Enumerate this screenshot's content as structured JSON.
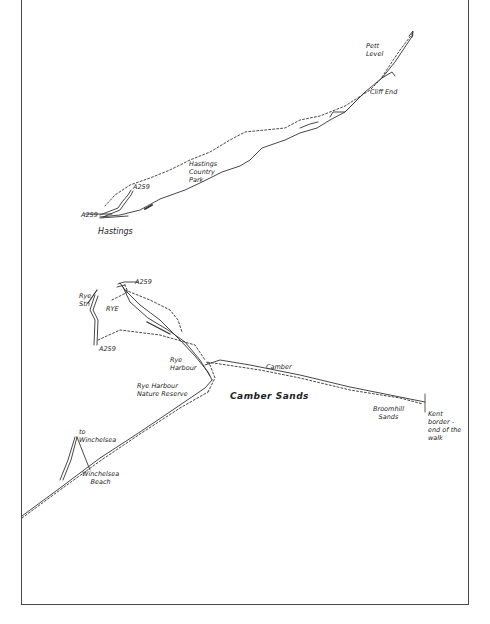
{
  "map": {
    "type": "hand-drawn coastal walk route map",
    "colors": {
      "ink": "#333333",
      "frame": "#4a4a4a",
      "background": "#ffffff"
    },
    "labels": {
      "pett_level_1": "Pett",
      "pett_level_2": "Level",
      "cliff_end": "Cliff End",
      "hastings_cp_1": "Hastings",
      "hastings_cp_2": "Country",
      "hastings_cp_3": "Park",
      "a259_hastings_north": "A259",
      "a259_hastings_west": "A259",
      "hastings": "Hastings",
      "a259_rye_north": "A259",
      "rye_stn_1": "Rye",
      "rye_stn_2": "Stn",
      "rye": "RYE",
      "a259_rye_south": "A259",
      "rye_harbour_1": "Rye",
      "rye_harbour_2": "Harbour",
      "camber": "Camber",
      "rye_harbour_nr_1": "Rye Harbour",
      "rye_harbour_nr_2": "Nature Reserve",
      "camber_sands": "Camber Sands",
      "broomhill_sands_1": "Broomhill",
      "broomhill_sands_2": "Sands",
      "kent_border_1": "Kent",
      "kent_border_2": "border -",
      "kent_border_3": "end of the",
      "kent_border_4": "walk",
      "to_winchelsea_1": "to",
      "to_winchelsea_2": "Winchelsea",
      "winchelsea_beach_1": "Winchelsea",
      "winchelsea_beach_2": "Beach"
    }
  }
}
